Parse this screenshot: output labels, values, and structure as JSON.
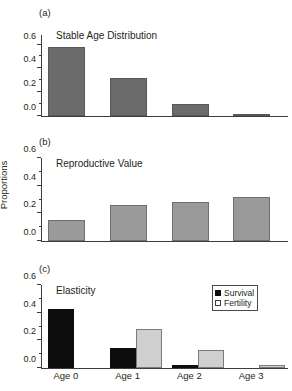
{
  "figure": {
    "ylabel": "Proportions",
    "xlabel": "",
    "categories": [
      "Age 0",
      "Age 1",
      "Age 2",
      "Age 3"
    ],
    "ytick_labels": [
      "0.0",
      "0.2",
      "0.4",
      "0.6"
    ],
    "colors": {
      "stable_age": "#6b6b6b",
      "reproductive_value": "#9a9a9a",
      "survival": "#0d0d0d",
      "fertility": "#cfcfcf",
      "axis": "#3d3d3d",
      "text": "#231f20"
    }
  },
  "panels": {
    "a": {
      "tag": "(a)",
      "title": "Stable Age Distribution"
    },
    "b": {
      "tag": "(b)",
      "title": "Reproductive Value"
    },
    "c": {
      "tag": "(c)",
      "title": "Elasticity"
    }
  },
  "legend": {
    "items": [
      {
        "label": "Survival",
        "swatch": "filled-square"
      },
      {
        "label": "Fertility",
        "swatch": "hollow-square"
      }
    ]
  },
  "chart_data": [
    {
      "type": "bar",
      "panel": "(a)",
      "title": "Stable Age Distribution",
      "xlabel": "",
      "ylabel": "Proportions",
      "categories": [
        "Age 0",
        "Age 1",
        "Age 2",
        "Age 3"
      ],
      "values": [
        0.58,
        0.32,
        0.1,
        0.02
      ],
      "ylim": [
        0.0,
        0.68
      ],
      "yticks": [
        0.0,
        0.2,
        0.4,
        0.6
      ],
      "yticks_minor": [
        0.1,
        0.3,
        0.5
      ],
      "grid": false,
      "legend": "none"
    },
    {
      "type": "bar",
      "panel": "(b)",
      "title": "Reproductive Value",
      "xlabel": "",
      "ylabel": "Proportions",
      "categories": [
        "Age 0",
        "Age 1",
        "Age 2",
        "Age 3"
      ],
      "values": [
        0.15,
        0.26,
        0.285,
        0.32
      ],
      "ylim": [
        0.0,
        0.6
      ],
      "yticks": [
        0.0,
        0.2,
        0.4,
        0.6
      ],
      "yticks_minor": [
        0.1,
        0.3,
        0.5
      ],
      "grid": false,
      "legend": "none"
    },
    {
      "type": "bar",
      "panel": "(c)",
      "title": "Elasticity",
      "xlabel": "",
      "ylabel": "Proportions",
      "categories": [
        "Age 0",
        "Age 1",
        "Age 2",
        "Age 3"
      ],
      "series": [
        {
          "name": "Survival",
          "values": [
            0.425,
            0.145,
            0.025,
            0.0
          ]
        },
        {
          "name": "Fertility",
          "values": [
            0.0,
            0.285,
            0.13,
            0.02
          ]
        }
      ],
      "ylim": [
        0.0,
        0.6
      ],
      "yticks": [
        0.0,
        0.2,
        0.4,
        0.6
      ],
      "yticks_minor": [
        0.1,
        0.3,
        0.5
      ],
      "grid": false,
      "legend": "top-right"
    }
  ]
}
